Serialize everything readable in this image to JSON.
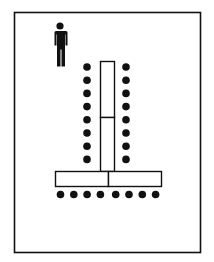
{
  "diagram": {
    "type": "seating-layout",
    "colors": {
      "background": "#ffffff",
      "ink": "#111111"
    },
    "presenter": {
      "icon": "person-icon",
      "count": 1
    },
    "tables": [
      {
        "name": "vertical-table",
        "orientation": "vertical",
        "segments": 2
      },
      {
        "name": "horizontal-table",
        "orientation": "horizontal",
        "segments": 2
      }
    ],
    "seats": {
      "left_column": 8,
      "right_column": 8,
      "bottom_row": 8,
      "total": 24
    }
  }
}
